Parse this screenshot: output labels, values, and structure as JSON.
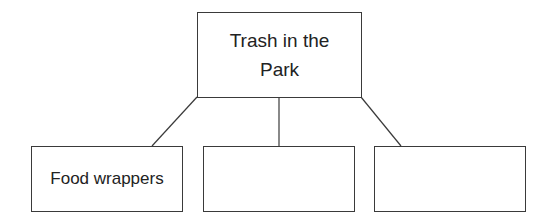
{
  "diagram": {
    "type": "tree",
    "root": {
      "label": "Trash in the Park"
    },
    "children": [
      {
        "label": "Food wrappers"
      },
      {
        "label": ""
      },
      {
        "label": ""
      }
    ],
    "colors": {
      "line": "#3a3a3a",
      "text": "#222222",
      "background": "#ffffff"
    }
  }
}
